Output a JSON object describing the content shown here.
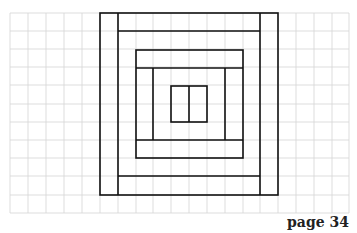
{
  "figure": {
    "grid": {
      "columns": 19,
      "rows": 11,
      "line_color": "#d4d4d4"
    },
    "stroke_color": "#111111"
  },
  "footer": {
    "page_label": "page 34"
  }
}
